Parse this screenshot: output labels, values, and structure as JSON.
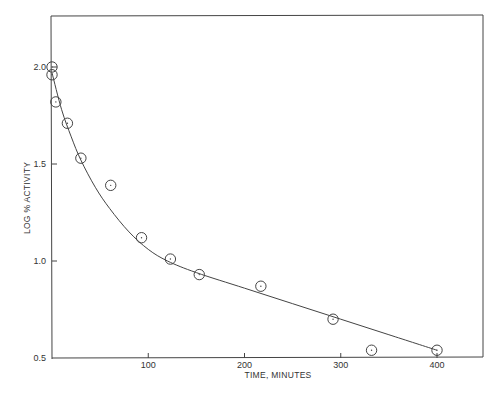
{
  "chart_data": {
    "type": "scatter",
    "title": "",
    "xlabel": "TIME, MINUTES",
    "ylabel": "LOG % ACTIVITY",
    "xlim": [
      0,
      450
    ],
    "ylim": [
      0.5,
      2.25
    ],
    "grid": false,
    "legend": null,
    "x_ticks": [
      100,
      200,
      300,
      400
    ],
    "x_tick_labels": [
      "100",
      "200",
      "300",
      "400"
    ],
    "y_ticks": [
      0.5,
      1.0,
      1.5,
      2.0
    ],
    "y_tick_labels": [
      "0.5",
      "1.0",
      "1.5",
      "2.0"
    ],
    "series": [
      {
        "name": "observed",
        "marker": "open-circle-with-dot",
        "x": [
          0,
          0,
          4,
          16,
          30,
          61,
          93,
          123,
          153,
          217,
          292,
          332,
          400
        ],
        "y": [
          2.0,
          1.96,
          1.82,
          1.71,
          1.53,
          1.39,
          1.12,
          1.01,
          0.93,
          0.87,
          0.7,
          0.54,
          0.54
        ]
      },
      {
        "name": "fitted curve",
        "marker": "line",
        "x": [
          0,
          10,
          20,
          30,
          45,
          60,
          80,
          100,
          120,
          150,
          200,
          250,
          300,
          350,
          400
        ],
        "y": [
          1.97,
          1.78,
          1.64,
          1.52,
          1.38,
          1.27,
          1.15,
          1.06,
          1.0,
          0.94,
          0.86,
          0.78,
          0.7,
          0.62,
          0.54
        ]
      }
    ]
  },
  "axes": {
    "x_label": "TIME, MINUTES",
    "y_label": "LOG % ACTIVITY",
    "x_tick_labels": [
      "100",
      "200",
      "300",
      "400"
    ],
    "y_tick_labels": [
      "0.5",
      "1.0",
      "1.5",
      "2.0"
    ]
  },
  "colors": {
    "ink": "#333333",
    "background": "#ffffff"
  }
}
